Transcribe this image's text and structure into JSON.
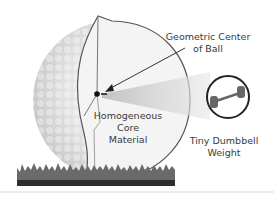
{
  "diagram": {
    "labels": {
      "geometric_center_line1": "Geometric Center",
      "geometric_center_line2": "of Ball",
      "core_line1": "Homogeneous",
      "core_line2": "Core",
      "core_line3": "Material",
      "weight_line1": "Tiny Dumbbell",
      "weight_line2": "Weight"
    },
    "icons": {
      "ball": "golf-ball-cutaway",
      "weight": "dumbbell-icon",
      "ground": "grass"
    },
    "colors": {
      "outline": "#444444",
      "ball_shade": "#d6d6d6",
      "core_fill": "#f3f3f3",
      "grass": "#555555",
      "beam": "#cfcfcf",
      "dumbbell": "#666666"
    }
  }
}
